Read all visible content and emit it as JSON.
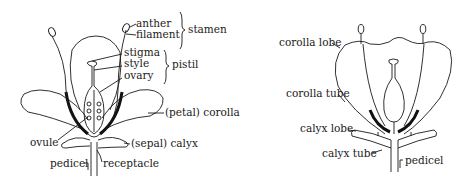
{
  "figures": [
    {
      "id": "complete-flower",
      "labels": {
        "anther": "anther",
        "filament": "filament",
        "stamen": "stamen",
        "stigma": "stigma",
        "style": "style",
        "ovary": "ovary",
        "pistil": "pistil",
        "corolla": "(petal) corolla",
        "ovule": "ovule",
        "calyx": "(sepal) calyx",
        "pedicel": "pedicel",
        "receptacle": "receptacle"
      }
    },
    {
      "id": "tubular-flower",
      "labels": {
        "corolla_lobe": "corolla lobe",
        "corolla_tube": "corolla tube",
        "calyx_lobe": "calyx lobe",
        "calyx_tube": "calyx tube",
        "pedicel": "pedicel"
      }
    }
  ],
  "colors": {
    "ink": "#1a1a1a",
    "background": "#ffffff"
  }
}
